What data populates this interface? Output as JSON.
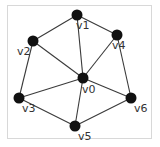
{
  "graph": {
    "nodes": [
      {
        "id": "v0",
        "label": "v0",
        "x": 83,
        "y": 78,
        "lx": 82,
        "ly": 93
      },
      {
        "id": "v1",
        "label": "v1",
        "x": 77,
        "y": 15,
        "lx": 76,
        "ly": 29
      },
      {
        "id": "v2",
        "label": "v2",
        "x": 33,
        "y": 41,
        "lx": 17,
        "ly": 55
      },
      {
        "id": "v3",
        "label": "v3",
        "x": 19,
        "y": 98,
        "lx": 22,
        "ly": 112
      },
      {
        "id": "v4",
        "label": "v4",
        "x": 117,
        "y": 35,
        "lx": 112,
        "ly": 49
      },
      {
        "id": "v5",
        "label": "v5",
        "x": 75,
        "y": 126,
        "lx": 78,
        "ly": 140
      },
      {
        "id": "v6",
        "label": "v6",
        "x": 131,
        "y": 98,
        "lx": 134,
        "ly": 112
      }
    ],
    "edges": [
      [
        "v1",
        "v2"
      ],
      [
        "v1",
        "v4"
      ],
      [
        "v1",
        "v0"
      ],
      [
        "v2",
        "v0"
      ],
      [
        "v2",
        "v3"
      ],
      [
        "v4",
        "v0"
      ],
      [
        "v4",
        "v6"
      ],
      [
        "v3",
        "v0"
      ],
      [
        "v3",
        "v5"
      ],
      [
        "v0",
        "v5"
      ],
      [
        "v0",
        "v6"
      ],
      [
        "v5",
        "v6"
      ]
    ],
    "colors": {
      "node": "#111111",
      "edge": "#3a3a3a",
      "label": "#333333",
      "frame": "#d8d8d8"
    }
  }
}
